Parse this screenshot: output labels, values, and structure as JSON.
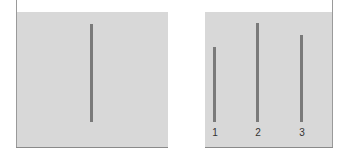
{
  "colors": {
    "panel": "#d8d8d8",
    "line": "#7a7a7a",
    "border": "#9a9a9a",
    "background": "#ffffff"
  },
  "left_panel": {
    "lines": [
      {
        "x": 90,
        "top": 24,
        "bottom": 122
      }
    ]
  },
  "right_panel": {
    "lines": [
      {
        "label": "1",
        "x": 213,
        "top": 47,
        "bottom": 122
      },
      {
        "label": "2",
        "x": 256,
        "top": 23,
        "bottom": 122
      },
      {
        "label": "3",
        "x": 300,
        "top": 35,
        "bottom": 122
      }
    ]
  }
}
